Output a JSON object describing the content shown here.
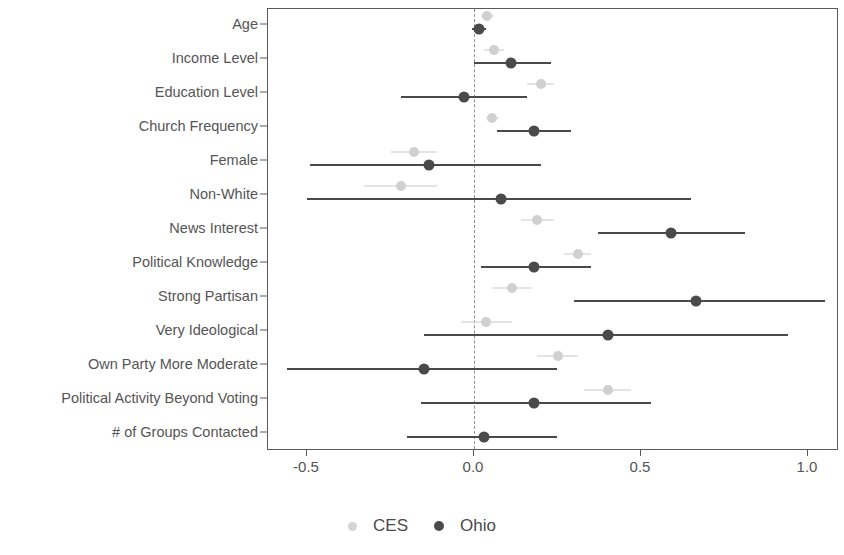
{
  "chart_data": {
    "type": "scatter",
    "title": "",
    "subtitle": "",
    "xlabel": "",
    "ylabel": "",
    "xlim": [
      -0.62,
      1.095
    ],
    "grid": false,
    "legend_position": "bottom",
    "zero_reference_line": 0.0,
    "xticks": [
      -0.5,
      0.0,
      0.5,
      1.0
    ],
    "xticklabels": [
      "-0.5",
      "0.0",
      "0.5",
      "1.0"
    ],
    "categories": [
      "Age",
      "Income Level",
      "Education Level",
      "Church Frequency",
      "Female",
      "Non-White",
      "News Interest",
      "Political Knowledge",
      "Strong Partisan",
      "Very Ideological",
      "Own Party More Moderate",
      "Political Activity Beyond Voting",
      "# of Groups Contacted"
    ],
    "series": [
      {
        "name": "CES",
        "color": "#d0d0d0",
        "estimates": [
          0.04,
          0.06,
          0.2,
          0.055,
          -0.18,
          -0.22,
          0.19,
          0.31,
          0.115,
          0.035,
          0.25,
          0.4,
          null
        ],
        "ci_low": [
          0.02,
          0.03,
          0.16,
          0.035,
          -0.25,
          -0.33,
          0.14,
          0.27,
          0.055,
          -0.04,
          0.19,
          0.33,
          null
        ],
        "ci_high": [
          0.06,
          0.09,
          0.24,
          0.075,
          -0.11,
          -0.11,
          0.24,
          0.35,
          0.175,
          0.115,
          0.31,
          0.47,
          null
        ]
      },
      {
        "name": "Ohio",
        "color": "#4a4a4a",
        "estimates": [
          0.015,
          0.11,
          -0.03,
          0.18,
          -0.135,
          0.08,
          0.59,
          0.18,
          0.665,
          0.4,
          -0.15,
          0.18,
          0.03
        ],
        "ci_low": [
          -0.005,
          0.0,
          -0.22,
          0.07,
          -0.49,
          -0.5,
          0.37,
          0.02,
          0.3,
          -0.15,
          -0.56,
          -0.16,
          -0.2
        ],
        "ci_high": [
          0.035,
          0.23,
          0.16,
          0.29,
          0.2,
          0.65,
          0.81,
          0.35,
          1.05,
          0.94,
          0.25,
          0.53,
          0.25
        ]
      }
    ]
  },
  "legend": {
    "entries": [
      {
        "label": "CES",
        "marker": "ces-legend-dot"
      },
      {
        "label": "Ohio",
        "marker": "ohio-legend-dot"
      }
    ]
  }
}
